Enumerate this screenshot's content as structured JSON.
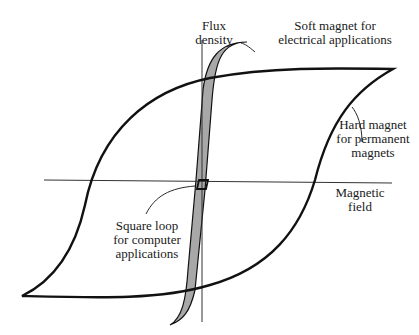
{
  "diagram": {
    "type": "hysteresis-loops",
    "axes": {
      "y_label": [
        "Flux",
        "density"
      ],
      "x_label": [
        "Magnetic",
        "field"
      ]
    },
    "annotations": {
      "soft_magnet": [
        "Soft magnet for",
        "electrical applications"
      ],
      "hard_magnet": [
        "Hard magnet",
        "for permanent",
        "magnets"
      ],
      "square_loop": [
        "Square loop",
        "for computer",
        "applications"
      ]
    },
    "colors": {
      "line": "#111111",
      "axis": "#333333",
      "soft_fill": "#a8a8a8",
      "background": "#ffffff"
    }
  }
}
